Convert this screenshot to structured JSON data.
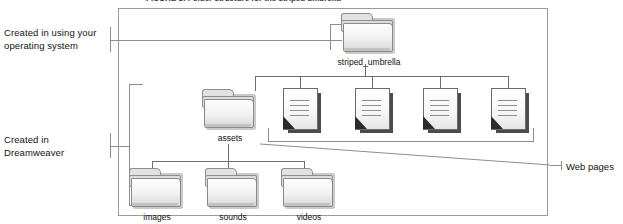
{
  "figure": {
    "caption": "FIGURE 3: Folder structure for the striped umbrella"
  },
  "callouts": {
    "os": "Created in using your\noperating system",
    "os_line1": "Created in using your",
    "os_line2": "operating system",
    "dreamweaver_line1": "Created in",
    "dreamweaver_line2": "Dreamweaver",
    "web_pages": "Web pages"
  },
  "tree": {
    "root": {
      "label": "striped_umbrella",
      "icon": "folder-icon"
    },
    "assets": {
      "label": "assets",
      "icon": "folder-icon"
    },
    "subfolders": [
      {
        "label": "images",
        "icon": "folder-icon"
      },
      {
        "label": "sounds",
        "icon": "folder-icon"
      },
      {
        "label": "videos",
        "icon": "folder-icon"
      }
    ],
    "pages": [
      {
        "label": "",
        "icon": "document-icon"
      },
      {
        "label": "",
        "icon": "document-icon"
      },
      {
        "label": "",
        "icon": "document-icon"
      },
      {
        "label": "",
        "icon": "document-icon"
      }
    ]
  },
  "colors": {
    "line": "#8d8d8d",
    "frame": "#9a9a9a",
    "text": "#111111",
    "folder_face": "#f1f1f1",
    "doc_shadow": "#3c3c3c",
    "page_bg": "#ffffff"
  }
}
